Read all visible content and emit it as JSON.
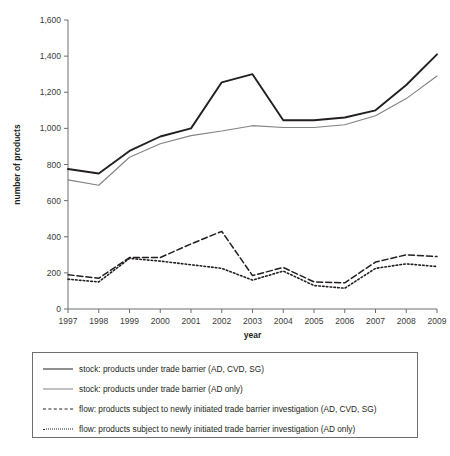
{
  "chart_data": {
    "type": "line",
    "title": "",
    "xlabel": "year",
    "ylabel": "number of products",
    "x": [
      1997,
      1998,
      1999,
      2000,
      2001,
      2002,
      2003,
      2004,
      2005,
      2006,
      2007,
      2008,
      2009
    ],
    "xticklabels": [
      "1997",
      "1998",
      "1999",
      "2000",
      "2001",
      "2002",
      "2003",
      "2004",
      "2005",
      "2006",
      "2007",
      "2008",
      "2009"
    ],
    "yticklabels": [
      "0",
      "200",
      "400",
      "600",
      "800",
      "1,000",
      "1,200",
      "1,400",
      "1,600"
    ],
    "yticks": [
      0,
      200,
      400,
      600,
      800,
      1000,
      1200,
      1400,
      1600
    ],
    "ylim": [
      0,
      1600
    ],
    "xlim": [
      1997,
      2009
    ],
    "grid": false,
    "legend_position": "below-plot",
    "series": [
      {
        "name": "stock: products under trade barrier (AD, CVD, SG)",
        "style": "solid-thick",
        "color": "#231f20",
        "values": [
          775,
          750,
          875,
          955,
          1000,
          1255,
          1300,
          1045,
          1045,
          1060,
          1100,
          1240,
          1410
        ]
      },
      {
        "name": "stock: products under trade barrier (AD only)",
        "style": "solid-thin",
        "color": "#808285",
        "values": [
          715,
          685,
          840,
          915,
          960,
          985,
          1015,
          1005,
          1005,
          1020,
          1070,
          1165,
          1290
        ]
      },
      {
        "name": "flow: products subject to newly initiated trade barrier investigation (AD, CVD, SG)",
        "style": "dashed",
        "color": "#231f20",
        "values": [
          190,
          170,
          285,
          285,
          360,
          430,
          185,
          230,
          150,
          145,
          260,
          300,
          290
        ]
      },
      {
        "name": "flow: products subject to newly initiated trade barrier investigation (AD only)",
        "style": "dotted",
        "color": "#231f20",
        "values": [
          165,
          150,
          280,
          265,
          245,
          225,
          160,
          210,
          130,
          115,
          225,
          250,
          235
        ]
      }
    ]
  },
  "legend": {
    "items": [
      {
        "label": "stock: products under trade barrier (AD, CVD, SG)",
        "style": "solid-thick"
      },
      {
        "label": "stock: products under trade barrier (AD only)",
        "style": "solid-thin"
      },
      {
        "label": "flow: products subject to newly initiated trade barrier investigation (AD, CVD, SG)",
        "style": "dashed"
      },
      {
        "label": "flow: products subject to newly initiated trade barrier investigation (AD only)",
        "style": "dotted"
      }
    ]
  },
  "colors": {
    "black": "#231f20",
    "gray": "#808285",
    "axis": "#6d6e71",
    "background": "#ffffff"
  }
}
